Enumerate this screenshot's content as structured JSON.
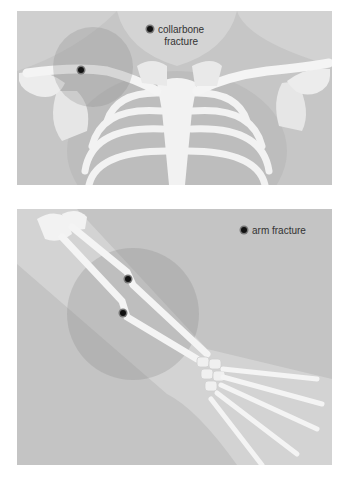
{
  "figure": {
    "panels": [
      {
        "id": "collarbone",
        "label_line1": "collarbone",
        "label_line2": "fracture",
        "marker_icon": "fracture-dot-icon",
        "fracture_points": [
          {
            "x": 82,
            "y": 67
          }
        ]
      },
      {
        "id": "arm",
        "label": "arm fracture",
        "marker_icon": "fracture-dot-icon",
        "fracture_points": [
          {
            "x": 128,
            "y": 274
          },
          {
            "x": 123,
            "y": 308
          }
        ]
      }
    ],
    "colors": {
      "background": "#c8c8c8",
      "body_light": "#d9d9d9",
      "bone": "#f4f4f4",
      "highlight": "#b0b0b0",
      "marker": "#111111",
      "text": "#333333"
    }
  }
}
